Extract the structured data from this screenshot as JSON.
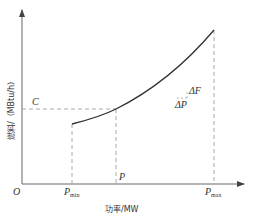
{
  "diagram": {
    "type": "fuel-cost curve",
    "axes": {
      "x_label": "功率/MW",
      "y_label": "燃料/（MBtu/h）",
      "origin": "O"
    },
    "x_ticks": [
      {
        "main": "P",
        "sub": "min"
      },
      {
        "main": "P",
        "sub": ""
      },
      {
        "main": "P",
        "sub": "max"
      }
    ],
    "y_ticks": [
      {
        "label": "C"
      }
    ],
    "annotations": {
      "delta_f": "ΔF",
      "delta_p": "ΔP"
    },
    "colors": {
      "axis": "#555555",
      "curve": "#333333",
      "dashed": "#999999"
    }
  }
}
